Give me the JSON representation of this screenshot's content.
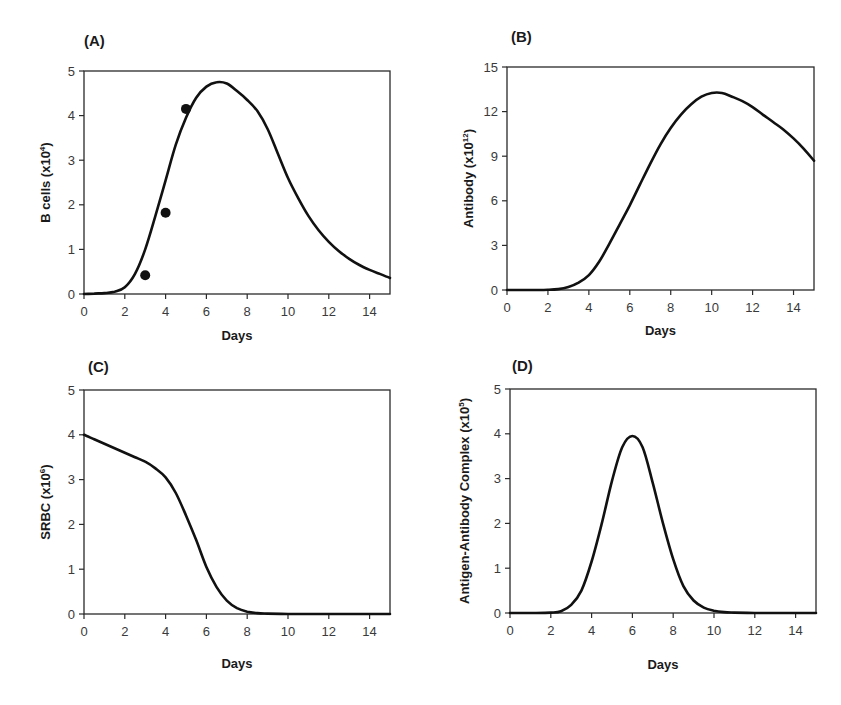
{
  "figure": {
    "panels": [
      {
        "id": "A",
        "label": "(A)",
        "ylabel": "B cells  (x10",
        "ylabel_exp": "4",
        "xlabel": "Days"
      },
      {
        "id": "B",
        "label": "(B)",
        "ylabel": "Antibody  (x10",
        "ylabel_exp": "12",
        "xlabel": "Days"
      },
      {
        "id": "C",
        "label": "(C)",
        "ylabel": "SRBC  (x10",
        "ylabel_exp": "6",
        "xlabel": "Days"
      },
      {
        "id": "D",
        "label": "(D)",
        "ylabel": "Antigen-Antibody Complex  (x10",
        "ylabel_exp": "5",
        "xlabel": "Days"
      }
    ]
  },
  "chart_data": [
    {
      "panel": "(A)",
      "type": "line",
      "title": "",
      "xlabel": "Days",
      "ylabel": "B cells (x10^4)",
      "xlim": [
        0,
        15
      ],
      "ylim": [
        0,
        5
      ],
      "xticks": [
        0,
        2,
        4,
        6,
        8,
        10,
        12,
        14
      ],
      "yticks": [
        0,
        1,
        2,
        3,
        4,
        5
      ],
      "grid": false,
      "series": [
        {
          "name": "model",
          "style": "line",
          "x": [
            0,
            0.5,
            1,
            1.5,
            2,
            2.5,
            3,
            3.5,
            4,
            4.5,
            5,
            5.5,
            6,
            6.5,
            7,
            7.5,
            8,
            8.5,
            9,
            9.5,
            10,
            10.5,
            11,
            11.5,
            12,
            12.5,
            13,
            13.5,
            14,
            14.5,
            15
          ],
          "y": [
            0,
            0.01,
            0.02,
            0.05,
            0.15,
            0.45,
            1.0,
            1.75,
            2.55,
            3.35,
            3.95,
            4.4,
            4.65,
            4.75,
            4.72,
            4.55,
            4.35,
            4.1,
            3.7,
            3.15,
            2.6,
            2.15,
            1.75,
            1.43,
            1.17,
            0.96,
            0.79,
            0.65,
            0.54,
            0.45,
            0.36
          ]
        },
        {
          "name": "observed",
          "style": "markers",
          "x": [
            3,
            4,
            5
          ],
          "y": [
            0.42,
            1.82,
            4.15
          ]
        }
      ]
    },
    {
      "panel": "(B)",
      "type": "line",
      "title": "",
      "xlabel": "Days",
      "ylabel": "Antibody (x10^12)",
      "xlim": [
        0,
        15
      ],
      "ylim": [
        0,
        15
      ],
      "xticks": [
        0,
        2,
        4,
        6,
        8,
        10,
        12,
        14
      ],
      "yticks": [
        0,
        3,
        6,
        9,
        12,
        15
      ],
      "grid": false,
      "series": [
        {
          "name": "model",
          "style": "line",
          "x": [
            0,
            1,
            2,
            2.5,
            3,
            3.5,
            4,
            4.5,
            5,
            5.5,
            6,
            6.5,
            7,
            7.5,
            8,
            8.5,
            9,
            9.5,
            10,
            10.5,
            11,
            11.5,
            12,
            12.5,
            13,
            13.5,
            14,
            14.5,
            15
          ],
          "y": [
            0,
            0,
            0.02,
            0.06,
            0.2,
            0.5,
            1.0,
            1.9,
            3.1,
            4.4,
            5.7,
            7.1,
            8.5,
            9.8,
            10.9,
            11.8,
            12.5,
            13.0,
            13.25,
            13.25,
            13.0,
            12.7,
            12.3,
            11.8,
            11.3,
            10.8,
            10.2,
            9.5,
            8.7
          ]
        }
      ]
    },
    {
      "panel": "(C)",
      "type": "line",
      "title": "",
      "xlabel": "Days",
      "ylabel": "SRBC (x10^6)",
      "xlim": [
        0,
        15
      ],
      "ylim": [
        0,
        5
      ],
      "xticks": [
        0,
        2,
        4,
        6,
        8,
        10,
        12,
        14
      ],
      "yticks": [
        0,
        1,
        2,
        3,
        4,
        5
      ],
      "grid": false,
      "series": [
        {
          "name": "model",
          "style": "line",
          "x": [
            0,
            0.5,
            1,
            1.5,
            2,
            2.5,
            3,
            3.5,
            4,
            4.5,
            5,
            5.5,
            6,
            6.5,
            7,
            7.5,
            8,
            8.5,
            9,
            10,
            11,
            12,
            13,
            14,
            15
          ],
          "y": [
            4.0,
            3.9,
            3.8,
            3.7,
            3.6,
            3.5,
            3.4,
            3.25,
            3.05,
            2.7,
            2.2,
            1.65,
            1.05,
            0.6,
            0.3,
            0.13,
            0.05,
            0.02,
            0.01,
            0.0,
            0.0,
            0.0,
            0.0,
            0.0,
            0.0
          ]
        }
      ]
    },
    {
      "panel": "(D)",
      "type": "line",
      "title": "",
      "xlabel": "Days",
      "ylabel": "Antigen-Antibody Complex (x10^5)",
      "xlim": [
        0,
        15
      ],
      "ylim": [
        0,
        5
      ],
      "xticks": [
        0,
        2,
        4,
        6,
        8,
        10,
        12,
        14
      ],
      "yticks": [
        0,
        1,
        2,
        3,
        4,
        5
      ],
      "grid": false,
      "series": [
        {
          "name": "model",
          "style": "line",
          "x": [
            0,
            1,
            2,
            2.5,
            3,
            3.5,
            4,
            4.5,
            5,
            5.5,
            6,
            6.5,
            7,
            7.5,
            8,
            8.5,
            9,
            9.5,
            10,
            10.5,
            11,
            12,
            13,
            14,
            15
          ],
          "y": [
            0,
            0,
            0.01,
            0.04,
            0.18,
            0.5,
            1.15,
            2.0,
            2.95,
            3.7,
            3.95,
            3.7,
            2.9,
            2.0,
            1.2,
            0.6,
            0.28,
            0.12,
            0.05,
            0.02,
            0.01,
            0.0,
            0.0,
            0.0,
            0.0
          ]
        }
      ]
    }
  ]
}
